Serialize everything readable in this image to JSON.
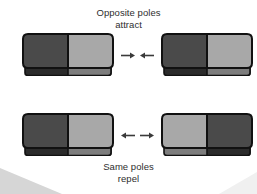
{
  "figure": {
    "background_color": "#ffffff",
    "width": 257,
    "height": 194
  },
  "captions": {
    "top": "Opposite poles\nattract",
    "bottom": "Same poles\nrepel",
    "text_color": "#2e2e2e"
  },
  "colors": {
    "north_pole_dark": "#4a4a4a",
    "south_pole_light": "#a8a8a8",
    "outline": "#111111",
    "edge_dark": "#2b2b2b",
    "edge_light": "#7d7d7d",
    "arrow": "#3a3a3a",
    "corner_wedge": "#d6d6d6"
  },
  "rows": [
    {
      "id": "attract-row",
      "label": "Opposite poles attract",
      "arrows": {
        "left_arrow": "arrow-right-icon",
        "right_arrow": "arrow-left-icon",
        "direction": "toward-each-other"
      },
      "magnets": [
        {
          "id": "magnet-top-left",
          "left_pole_color": "#4a4a4a",
          "right_pole_color": "#a8a8a8",
          "orientation": "dark-left"
        },
        {
          "id": "magnet-top-right",
          "left_pole_color": "#4a4a4a",
          "right_pole_color": "#a8a8a8",
          "orientation": "dark-left"
        }
      ]
    },
    {
      "id": "repel-row",
      "label": "Same poles repel",
      "arrows": {
        "left_arrow": "arrow-left-icon",
        "right_arrow": "arrow-right-icon",
        "direction": "away-from-each-other"
      },
      "magnets": [
        {
          "id": "magnet-bottom-left",
          "left_pole_color": "#4a4a4a",
          "right_pole_color": "#a8a8a8",
          "orientation": "dark-left"
        },
        {
          "id": "magnet-bottom-right",
          "left_pole_color": "#a8a8a8",
          "right_pole_color": "#4a4a4a",
          "orientation": "light-left"
        }
      ]
    }
  ]
}
